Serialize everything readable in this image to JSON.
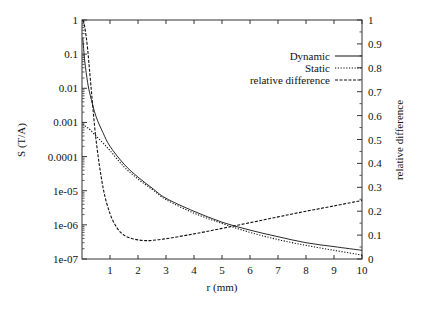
{
  "chart_data": {
    "type": "line",
    "title": "",
    "xlabel": "r (mm)",
    "ylabel": "S (T/A)",
    "y2label": "relative difference",
    "xlim": [
      0,
      10
    ],
    "ylim": [
      1e-07,
      1
    ],
    "yscale": "log",
    "y2lim": [
      0,
      1
    ],
    "y2scale": "linear",
    "grid": false,
    "legend_position": "upper right",
    "x_ticks": [
      "1",
      "2",
      "3",
      "4",
      "5",
      "6",
      "7",
      "8",
      "9",
      "10"
    ],
    "y_ticks": [
      "1",
      "0.1",
      "0.01",
      "0.001",
      "0.0001",
      "1e-05",
      "1e-06",
      "1e-07"
    ],
    "y2_ticks": [
      "1",
      "0.9",
      "0.8",
      "0.7",
      "0.6",
      "0.5",
      "0.4",
      "0.3",
      "0.2",
      "0.1",
      "0"
    ],
    "series": [
      {
        "name": "Dynamic",
        "axis": "left",
        "style": "solid",
        "x": [
          0.03,
          0.1,
          0.2,
          0.3,
          0.5,
          0.75,
          1,
          1.5,
          2,
          2.5,
          3,
          4,
          5,
          6,
          7,
          8,
          9,
          10
        ],
        "values": [
          0.3,
          0.06,
          0.015,
          0.006,
          0.0015,
          0.0005,
          0.0002,
          6e-05,
          2.5e-05,
          1.2e-05,
          6e-06,
          2.5e-06,
          1.2e-06,
          7e-07,
          4.5e-07,
          3e-07,
          2.3e-07,
          1.8e-07
        ]
      },
      {
        "name": "Static",
        "axis": "left",
        "style": "dotted",
        "x": [
          0.03,
          0.1,
          0.2,
          0.3,
          0.5,
          0.75,
          1,
          1.5,
          2,
          2.5,
          3,
          4,
          5,
          6,
          7,
          8,
          9,
          10
        ],
        "values": [
          0.0009,
          0.0008,
          0.0007,
          0.0006,
          0.0004,
          0.00025,
          0.00015,
          5e-05,
          2.2e-05,
          1.1e-05,
          5.5e-06,
          2.2e-06,
          1.1e-06,
          6e-07,
          3.7e-07,
          2.5e-07,
          1.8e-07,
          1.3e-07
        ]
      },
      {
        "name": "relative difference",
        "axis": "right",
        "style": "dashed",
        "x": [
          0.03,
          0.1,
          0.2,
          0.3,
          0.5,
          0.75,
          1,
          1.25,
          1.5,
          1.75,
          2,
          2.25,
          2.5,
          3,
          4,
          5,
          6,
          7,
          8,
          9,
          10
        ],
        "values": [
          1.0,
          0.97,
          0.88,
          0.75,
          0.5,
          0.3,
          0.19,
          0.13,
          0.1,
          0.087,
          0.08,
          0.077,
          0.078,
          0.085,
          0.105,
          0.128,
          0.152,
          0.176,
          0.2,
          0.222,
          0.245
        ]
      }
    ]
  },
  "legend": {
    "items": [
      {
        "label": "Dynamic",
        "style": "solid"
      },
      {
        "label": "Static",
        "style": "dotted"
      },
      {
        "label": "relative difference",
        "style": "dashed"
      }
    ]
  },
  "colors": {
    "axis": "#333333",
    "line": "#111111",
    "background": "#ffffff"
  }
}
